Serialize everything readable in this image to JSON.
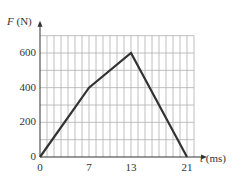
{
  "chart_data": {
    "type": "line",
    "title": "",
    "xlabel_var": "t",
    "xlabel_unit": "(ms)",
    "ylabel_var": "F",
    "ylabel_unit": "(N)",
    "x_ticks": [
      "0",
      "7",
      "13",
      "21"
    ],
    "y_ticks": [
      "0",
      "200",
      "400",
      "600"
    ],
    "xlim": [
      0,
      22
    ],
    "ylim": [
      0,
      700
    ],
    "grid": true,
    "grid_x_step": 1,
    "grid_y_step": 100,
    "series": [
      {
        "name": "F(t)",
        "x": [
          0,
          7,
          13,
          21
        ],
        "y": [
          0,
          400,
          600,
          0
        ]
      }
    ],
    "colors": {
      "line": "#333333",
      "grid": "#b0b0b0",
      "axis": "#333333"
    }
  }
}
